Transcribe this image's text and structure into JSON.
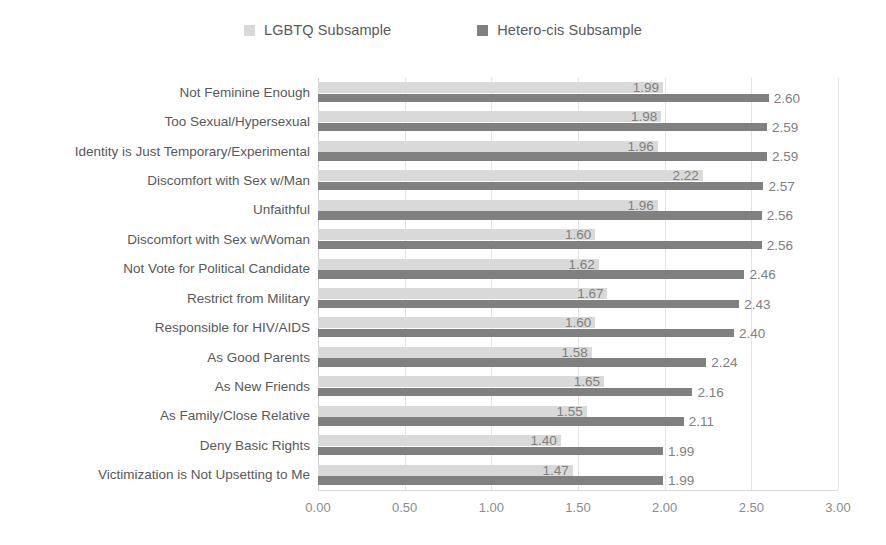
{
  "legend": {
    "position": "top-center",
    "items": [
      {
        "label": "LGBTQ Subsample",
        "color": "#d9d9d9",
        "icon": "square-swatch"
      },
      {
        "label": "Hetero-cis Subsample",
        "color": "#808080",
        "icon": "square-swatch"
      }
    ]
  },
  "chart_data": {
    "type": "bar",
    "orientation": "horizontal",
    "title": "",
    "xlabel": "",
    "ylabel": "",
    "xlim": [
      0,
      3
    ],
    "xticks": [
      "0.00",
      "0.50",
      "1.00",
      "1.50",
      "2.00",
      "2.50",
      "3.00"
    ],
    "xtick_values": [
      0,
      0.5,
      1,
      1.5,
      2,
      2.5,
      3
    ],
    "grid": true,
    "legend_position": "top-center",
    "categories": [
      "Not Feminine Enough",
      "Too Sexual/Hypersexual",
      "Identity is Just Temporary/Experimental",
      "Discomfort with Sex w/Man",
      "Unfaithful",
      "Discomfort with Sex w/Woman",
      "Not Vote for Political Candidate",
      "Restrict from Military",
      "Responsible for HIV/AIDS",
      "As Good Parents",
      "As New Friends",
      "As Family/Close Relative",
      "Deny Basic Rights",
      "Victimization is Not Upsetting to Me"
    ],
    "series": [
      {
        "name": "LGBTQ Subsample",
        "color": "#d9d9d9",
        "values": [
          1.99,
          1.98,
          1.96,
          2.22,
          1.96,
          1.6,
          1.62,
          1.67,
          1.6,
          1.58,
          1.65,
          1.55,
          1.4,
          1.47
        ],
        "labels": [
          "1.99",
          "1.98",
          "1.96",
          "2.22",
          "1.96",
          "1.60",
          "1.62",
          "1.67",
          "1.60",
          "1.58",
          "1.65",
          "1.55",
          "1.40",
          "1.47"
        ]
      },
      {
        "name": "Hetero-cis Subsample",
        "color": "#808080",
        "values": [
          2.6,
          2.59,
          2.59,
          2.57,
          2.56,
          2.56,
          2.46,
          2.43,
          2.4,
          2.24,
          2.16,
          2.11,
          1.99,
          1.99
        ],
        "labels": [
          "2.60",
          "2.59",
          "2.59",
          "2.57",
          "2.56",
          "2.56",
          "2.46",
          "2.43",
          "2.40",
          "2.24",
          "2.16",
          "2.11",
          "1.99",
          "1.99"
        ]
      }
    ]
  }
}
